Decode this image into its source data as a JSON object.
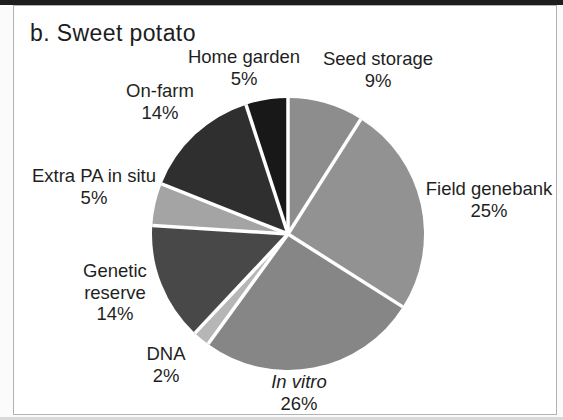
{
  "chart_data": {
    "type": "pie",
    "title": "b. Sweet potato",
    "start_angle_deg": 0,
    "direction": "clockwise",
    "legend": "none",
    "label_style": "outside-callout-free-text",
    "slices": [
      {
        "label": "Seed storage",
        "value": 9,
        "color": "#8d8d8d",
        "label_x": 378,
        "label_y": 48
      },
      {
        "label": "Field genebank",
        "value": 25,
        "color": "#929292",
        "label_x": 489,
        "label_y": 178
      },
      {
        "label": "In vitro",
        "value": 26,
        "color": "#868686",
        "italic": true,
        "label_x": 299,
        "label_y": 371
      },
      {
        "label": "DNA",
        "value": 2,
        "color": "#b6b6b6",
        "label_x": 166,
        "label_y": 343
      },
      {
        "label": "Genetic reserve",
        "value": 14,
        "color": "#484848",
        "name_lines": [
          "Genetic",
          "reserve"
        ],
        "label_x": 115,
        "label_y": 260
      },
      {
        "label": "Extra PA in situ",
        "value": 5,
        "color": "#a4a4a4",
        "label_x": 94,
        "label_y": 165
      },
      {
        "label": "On-farm",
        "value": 14,
        "color": "#2f2f2f",
        "label_x": 160,
        "label_y": 80
      },
      {
        "label": "Home garden",
        "value": 5,
        "color": "#181818",
        "label_x": 244,
        "label_y": 46
      }
    ],
    "geometry": {
      "cx": 288,
      "cy": 234,
      "r": 136,
      "divider_color": "#ffffff",
      "divider_width": 3.5
    },
    "colors_note": {
      "frame_border": "#b2b2b2",
      "top_edge_bar": "#1e1e1e",
      "text": "#1f1f1f"
    }
  }
}
